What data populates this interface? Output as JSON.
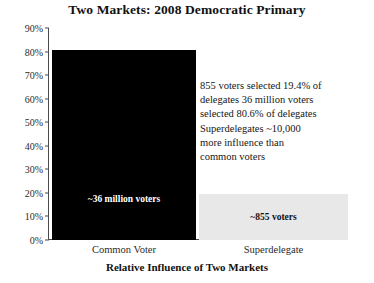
{
  "chart_data": {
    "type": "bar",
    "title": "Two Markets: 2008 Democratic Primary",
    "xlabel": "Relative Influence of Two Markets",
    "ylabel": "",
    "categories": [
      "Common Voter",
      "Superdelegate"
    ],
    "values": [
      80.6,
      19.4
    ],
    "bar_labels": [
      "~36 million voters",
      "~855 voters"
    ],
    "bar_colors": [
      "#000000",
      "#e8e8e8"
    ],
    "ylim": [
      0,
      90
    ],
    "ytick_values": [
      90,
      80,
      70,
      60,
      50,
      40,
      30,
      20,
      10,
      0
    ],
    "ytick_labels": [
      "90%",
      "80%",
      "70%",
      "60%",
      "50%",
      "40%",
      "30%",
      "20%",
      "10%",
      "0%"
    ],
    "grid": false,
    "legend": false,
    "annotation_lines": [
      "855 voters selected 19.4% of",
      "delegates 36 million voters",
      "selected 80.6% of delegates",
      "Superdelegates ~10,000",
      "more influence than",
      "common voters"
    ]
  }
}
